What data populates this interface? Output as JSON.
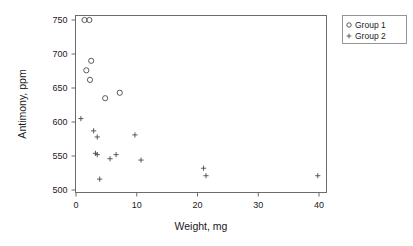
{
  "chart_data": {
    "type": "scatter",
    "title": "",
    "xlabel": "Weight, mg",
    "ylabel": "Antimony, ppm",
    "xlim": [
      -1.5,
      41.5
    ],
    "ylim": [
      495,
      757
    ],
    "xticks": [
      0,
      10,
      20,
      30,
      40
    ],
    "yticks": [
      500,
      550,
      600,
      650,
      700,
      750
    ],
    "xticklabels": [
      "0",
      "10",
      "20",
      "30",
      "40"
    ],
    "yticklabels": [
      "500",
      "550",
      "600",
      "650",
      "700",
      "750"
    ],
    "grid": false,
    "legend_position": "outside-top-right",
    "series": [
      {
        "name": "Group 1",
        "marker": "circle-open",
        "points": [
          {
            "x": 1.4,
            "y": 750
          },
          {
            "x": 2.2,
            "y": 750
          },
          {
            "x": 2.5,
            "y": 690
          },
          {
            "x": 1.7,
            "y": 676
          },
          {
            "x": 2.3,
            "y": 662
          },
          {
            "x": 4.8,
            "y": 635
          },
          {
            "x": 7.2,
            "y": 643
          }
        ]
      },
      {
        "name": "Group 2",
        "marker": "plus",
        "points": [
          {
            "x": 0.8,
            "y": 605
          },
          {
            "x": 2.9,
            "y": 587
          },
          {
            "x": 3.5,
            "y": 578
          },
          {
            "x": 3.2,
            "y": 554
          },
          {
            "x": 3.5,
            "y": 552
          },
          {
            "x": 5.6,
            "y": 546
          },
          {
            "x": 6.6,
            "y": 552
          },
          {
            "x": 9.7,
            "y": 581
          },
          {
            "x": 10.7,
            "y": 544
          },
          {
            "x": 3.9,
            "y": 516
          },
          {
            "x": 21.0,
            "y": 532
          },
          {
            "x": 21.4,
            "y": 521
          },
          {
            "x": 39.8,
            "y": 521
          }
        ]
      }
    ],
    "legend_entries": [
      {
        "label": "Group 1",
        "marker": "circle-open"
      },
      {
        "label": "Group 2",
        "marker": "plus"
      }
    ],
    "colors": {
      "marker": "#4a4a4a",
      "axis": "#6b6b6b",
      "text": "#1a1a1a",
      "background": "#ffffff"
    }
  }
}
